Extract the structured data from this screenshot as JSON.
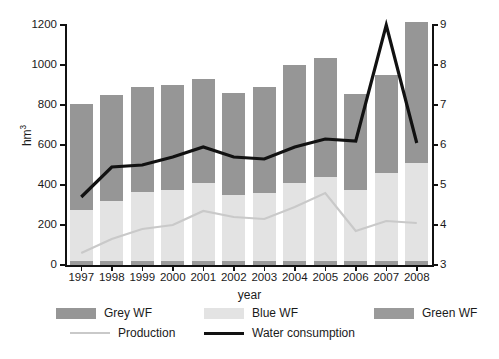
{
  "chart_data": {
    "type": "bar",
    "title": "",
    "xlabel": "year",
    "ylabel": "hm³",
    "y2label": "Water consumption (10⁻³m³/ha), Production (10⁶t)",
    "ylim": [
      0,
      1200
    ],
    "y2lim": [
      3,
      9
    ],
    "yticks": [
      0,
      200,
      400,
      600,
      800,
      1000,
      1200
    ],
    "y2ticks": [
      3,
      4,
      5,
      6,
      7,
      8,
      9
    ],
    "grid": false,
    "legend_position": "bottom",
    "stacked": true,
    "categories": [
      "1997",
      "1998",
      "1999",
      "2000",
      "2001",
      "2002",
      "2003",
      "2004",
      "2005",
      "2006",
      "2007",
      "2008"
    ],
    "series": [
      {
        "name": "Green WF",
        "kind": "bar",
        "color": "#9a9a9a",
        "axis": "left",
        "values": [
          20,
          18,
          18,
          18,
          18,
          18,
          18,
          18,
          20,
          18,
          20,
          22
        ]
      },
      {
        "name": "Blue WF",
        "kind": "bar",
        "color": "#e3e3e3",
        "axis": "left",
        "values": [
          255,
          300,
          345,
          355,
          390,
          330,
          340,
          390,
          420,
          355,
          440,
          490
        ]
      },
      {
        "name": "Grey WF",
        "kind": "bar",
        "color": "#969696",
        "axis": "left",
        "values": [
          530,
          532,
          527,
          527,
          522,
          512,
          532,
          592,
          595,
          482,
          490,
          703
        ]
      },
      {
        "name": "Production",
        "kind": "line",
        "color": "#c9c9c9",
        "axis": "right",
        "values": [
          3.3,
          3.65,
          3.9,
          4.0,
          4.35,
          4.2,
          4.15,
          4.45,
          4.8,
          3.85,
          4.1,
          4.05
        ]
      },
      {
        "name": "Water consumption",
        "kind": "line",
        "color": "#111111",
        "axis": "right",
        "values": [
          4.7,
          5.45,
          5.5,
          5.7,
          5.95,
          5.7,
          5.65,
          5.95,
          6.15,
          6.1,
          9.0,
          6.05
        ]
      }
    ],
    "bar_totals": [
      805,
      850,
      890,
      900,
      930,
      860,
      890,
      1000,
      1035,
      855,
      950,
      1215
    ]
  },
  "axes": {
    "left_title": "hm",
    "left_title_sup": "3",
    "x_title": "year",
    "right_title_a": "Water consumption (10",
    "right_title_sup1": "-3",
    "right_title_b": "m",
    "right_title_sup2": "3",
    "right_title_c": "/ha), Production (10",
    "right_title_sup3": "6",
    "right_title_d": "t)"
  },
  "legend": {
    "items": [
      {
        "label": "Grey WF",
        "type": "swatch",
        "color": "#969696"
      },
      {
        "label": "Blue WF",
        "type": "swatch",
        "color": "#e3e3e3"
      },
      {
        "label": "Green WF",
        "type": "swatch",
        "color": "#9a9a9a"
      },
      {
        "label": "Production",
        "type": "line",
        "color": "#c9c9c9"
      },
      {
        "label": "Water consumption",
        "type": "line",
        "color": "#111111"
      }
    ]
  }
}
